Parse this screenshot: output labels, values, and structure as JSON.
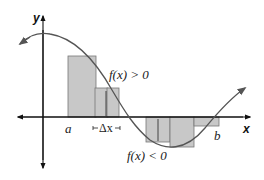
{
  "diagram": {
    "type": "riemann-sum",
    "axes": {
      "x_label": "x",
      "y_label": "y"
    },
    "labels": {
      "a": "a",
      "b": "b",
      "delta_x": "Δx",
      "positive": "f(x) > 0",
      "negative": "f(x) < 0"
    },
    "colors": {
      "rect_fill": "#c8c8c8",
      "rect_stroke": "#777777",
      "curve": "#555555",
      "axis": "#111111"
    }
  }
}
